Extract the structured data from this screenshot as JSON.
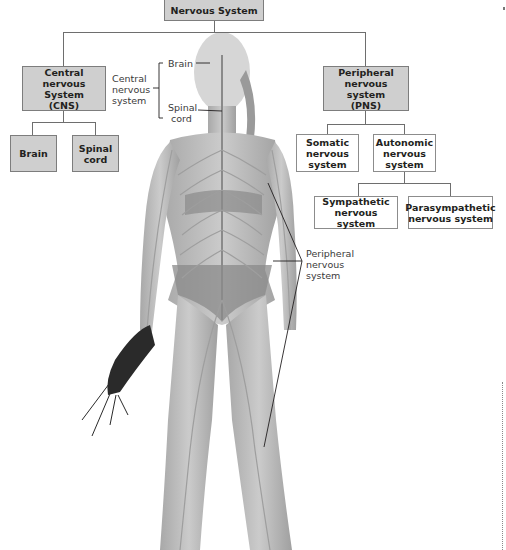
{
  "diagram": {
    "title": "Nervous System",
    "nodes": {
      "root": {
        "label": "Nervous System"
      },
      "cns": {
        "label_lines": [
          "Central",
          "nervous System",
          "(CNS)"
        ]
      },
      "cns_brain": {
        "label": "Brain"
      },
      "cns_spinal": {
        "label_lines": [
          "Spinal",
          "cord"
        ]
      },
      "pns": {
        "label_lines": [
          "Peripheral",
          "nervous system",
          "(PNS)"
        ]
      },
      "somatic": {
        "label_lines": [
          "Somatic",
          "nervous",
          "system"
        ]
      },
      "autonomic": {
        "label_lines": [
          "Autonomic",
          "nervous",
          "system"
        ]
      },
      "sympathetic": {
        "label_lines": [
          "Sympathetic",
          "nervous system"
        ]
      },
      "parasympathetic": {
        "label_lines": [
          "Parasympathetic",
          "nervous system"
        ]
      }
    },
    "callouts": {
      "cns": {
        "label_lines": [
          "Central",
          "nervous",
          "system"
        ]
      },
      "brain": {
        "label": "Brain"
      },
      "spinal": {
        "label_lines": [
          "Spinal",
          "cord"
        ]
      },
      "pns": {
        "label_lines": [
          "Peripheral",
          "nervous",
          "system"
        ]
      }
    },
    "figure": {
      "description": "Standing female athlete holding running shoes, overlaid with nervous system illustration",
      "colors": {
        "skin": "#bdbdbd",
        "nerve": "#9a9a9a",
        "clothing": "#8a8a8a",
        "shoe": "#2a2a2a"
      }
    },
    "colors": {
      "box_fill": "#cfcfcf",
      "box_border": "#7d7d7d",
      "connector": "#6e6e6e"
    }
  }
}
